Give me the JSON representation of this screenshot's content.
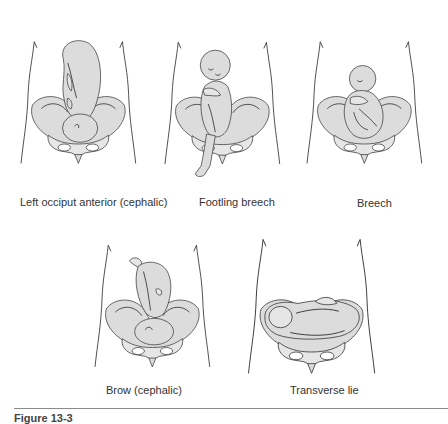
{
  "figure": {
    "caption": "Figure 13-3",
    "panels": [
      {
        "id": "loa",
        "label": "Left occiput anterior (cephalic)"
      },
      {
        "id": "footling-breech",
        "label": "Footling breech"
      },
      {
        "id": "breech",
        "label": "Breech"
      },
      {
        "id": "brow",
        "label": "Brow (cephalic)"
      },
      {
        "id": "transverse",
        "label": "Transverse lie"
      }
    ]
  },
  "colors": {
    "line": "#3a3a3a",
    "fill": "#dcdcdc",
    "background": "#ffffff",
    "divider": "#8a8a8a"
  }
}
